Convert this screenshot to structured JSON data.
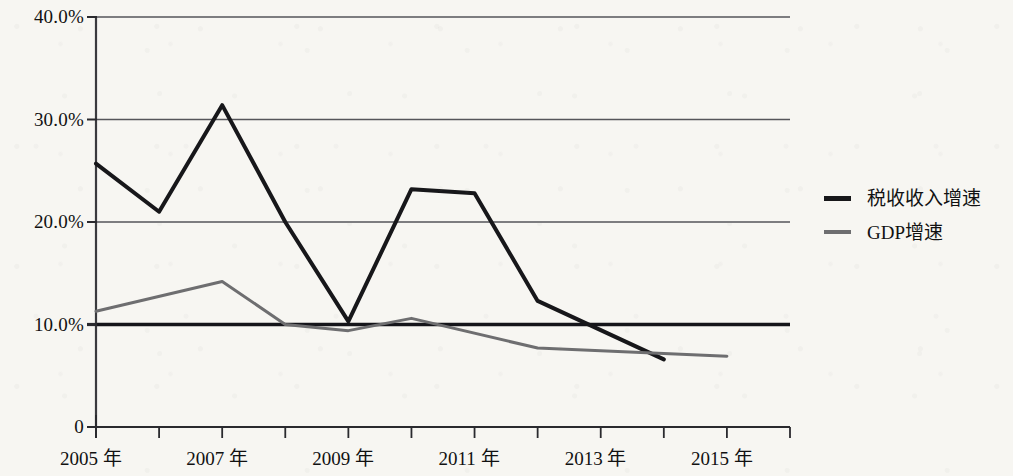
{
  "chart_data": {
    "type": "line",
    "title": "",
    "subtitle": "",
    "xlabel": "",
    "ylabel": "",
    "grid": true,
    "legend_position": "right",
    "x": [
      2005,
      2006,
      2007,
      2008,
      2009,
      2010,
      2011,
      2012,
      2013,
      2014,
      2015,
      2016
    ],
    "xlim": [
      2005,
      2016
    ],
    "ylim": [
      0,
      40
    ],
    "ytick_labels": [
      "0",
      "10.0%",
      "20.0%",
      "30.0%",
      "40.0%"
    ],
    "ytick_values": [
      0,
      10,
      20,
      30,
      40
    ],
    "xtick_labels": [
      "2005 年",
      "2007 年",
      "2009 年",
      "2011 年",
      "2013 年",
      "2015 年"
    ],
    "xtick_label_values": [
      2005,
      2007,
      2009,
      2011,
      2013,
      2015
    ],
    "series": [
      {
        "name": "税收收入增速",
        "color": "#17171a",
        "width": 4,
        "x": [
          2005,
          2006,
          2007,
          2008,
          2009,
          2010,
          2011,
          2012,
          2014
        ],
        "values": [
          25.7,
          21.0,
          31.4,
          20.0,
          10.3,
          23.2,
          22.8,
          12.3,
          6.6
        ]
      },
      {
        "name": "GDP增速",
        "color": "#6e6e70",
        "width": 3,
        "x": [
          2005,
          2007,
          2008,
          2009,
          2010,
          2012,
          2015
        ],
        "values": [
          11.3,
          14.2,
          10.0,
          9.4,
          10.6,
          7.7,
          6.9
        ]
      }
    ]
  },
  "legend": {
    "items": [
      {
        "label": "税收收入增速",
        "series": "tax"
      },
      {
        "label": "GDP增速",
        "series": "gdp"
      }
    ]
  }
}
